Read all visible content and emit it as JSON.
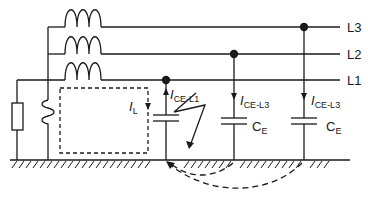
{
  "diagram": {
    "type": "circuit",
    "phases": [
      {
        "id": "L3",
        "label": "L3"
      },
      {
        "id": "L2",
        "label": "L2"
      },
      {
        "id": "L1",
        "label": "L1"
      }
    ],
    "currents": {
      "fault_current": {
        "symbol": "I",
        "subscript": "L"
      },
      "leak_L1": {
        "symbol": "I",
        "subscript": "CE-L1"
      },
      "leak_L2": {
        "symbol": "I",
        "subscript": "CE-L3"
      },
      "leak_L3": {
        "symbol": "I",
        "subscript": "CE-L3"
      }
    },
    "capacitors": [
      {
        "symbol": "C",
        "subscript": "E"
      },
      {
        "symbol": "C",
        "subscript": "E"
      }
    ],
    "colors": {
      "stroke": "#1a1a1a",
      "background": "#ffffff"
    }
  }
}
